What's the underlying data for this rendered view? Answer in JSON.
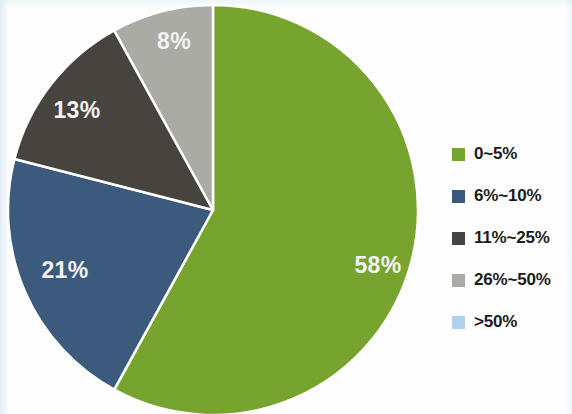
{
  "chart_data": {
    "type": "pie",
    "title": "",
    "subtitle": "",
    "xlabel": "",
    "ylabel": "",
    "legend_position": "right",
    "grid": false,
    "start_angle_deg": 0,
    "direction": "clockwise",
    "categories": [
      "0~5%",
      "6%~10%",
      "11%~25%",
      "26%~50%",
      ">50%"
    ],
    "values": [
      58,
      21,
      13,
      8,
      0
    ],
    "value_unit": "%",
    "data_labels": [
      "58%",
      "21%",
      "13%",
      "8%",
      ""
    ],
    "colors": [
      "#76a42e",
      "#3c5b7c",
      "#474440",
      "#ababa6",
      "#afd3ee"
    ],
    "slices": [
      {
        "label": "0~5%",
        "value": 58,
        "data_label": "58%",
        "color": "#76a42e",
        "start_deg": 0,
        "end_deg": 208.8,
        "label_x": 378,
        "label_y": 267,
        "visible": true
      },
      {
        "label": "6%~10%",
        "value": 21,
        "data_label": "21%",
        "color": "#3c5b7c",
        "start_deg": 208.8,
        "end_deg": 284.4,
        "label_x": 65,
        "label_y": 272,
        "visible": true
      },
      {
        "label": "11%~25%",
        "value": 13,
        "data_label": "13%",
        "color": "#474440",
        "start_deg": 284.4,
        "end_deg": 331.2,
        "label_x": 77,
        "label_y": 112,
        "visible": true
      },
      {
        "label": "26%~50%",
        "value": 8,
        "data_label": "8%",
        "color": "#ababa6",
        "start_deg": 331.2,
        "end_deg": 360,
        "label_x": 174,
        "label_y": 43,
        "visible": true
      },
      {
        "label": ">50%",
        "value": 0,
        "data_label": "",
        "color": "#afd3ee",
        "start_deg": 360,
        "end_deg": 360,
        "label_x": 0,
        "label_y": 0,
        "visible": false
      }
    ]
  },
  "legend": {
    "items": [
      {
        "label": "0~5%",
        "color": "#76a42e"
      },
      {
        "label": "6%~10%",
        "color": "#3c5b7c"
      },
      {
        "label": "11%~25%",
        "color": "#474440"
      },
      {
        "label": "26%~50%",
        "color": "#ababa6"
      },
      {
        "label": ">50%",
        "color": "#afd3ee"
      }
    ]
  },
  "geometry": {
    "center_x": 213,
    "center_y": 210,
    "radius": 205,
    "separator_color": "#ffffff",
    "separator_width": 2.5,
    "background": "#fdfdfd"
  }
}
